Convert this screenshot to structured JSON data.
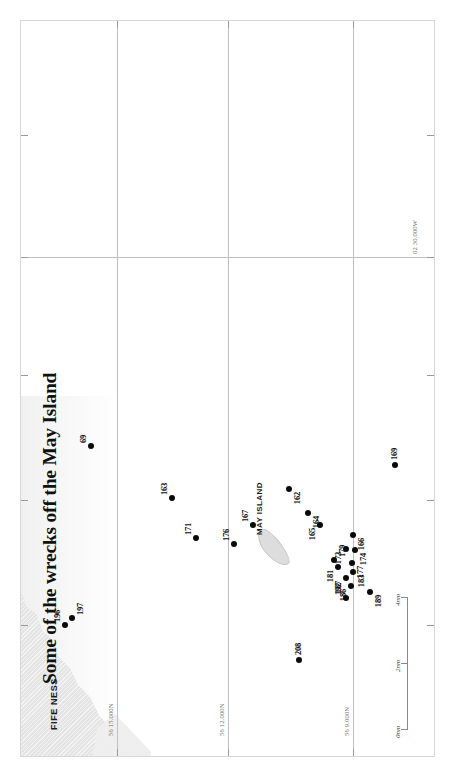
{
  "title": "Some of the wrecks off the May Island",
  "labels": {
    "fife_ness": "FIFE NESS",
    "may_island": "MAY ISLAND"
  },
  "graticule": {
    "latitudes": [
      {
        "text": "56 15.000N",
        "y": 96
      },
      {
        "text": "56 12.000N",
        "y": 207
      },
      {
        "text": "56 9.000N",
        "y": 332
      }
    ],
    "longitudes": [
      {
        "text": "02 30.000W",
        "x": 498
      }
    ]
  },
  "scale": {
    "ticks": [
      "0nm",
      "2nm",
      "4nm"
    ]
  },
  "chart_data": {
    "type": "scatter",
    "title": "Some of the wrecks off the May Island",
    "xlabel": "Longitude",
    "ylabel": "Latitude",
    "grid": true,
    "legend": "none",
    "annotations": [
      "FIFE NESS",
      "MAY ISLAND"
    ],
    "axis_ticks": {
      "latitude": [
        "56 15.000N",
        "56 12.000N",
        "56 9.000N"
      ],
      "longitude": [
        "02 30.000W"
      ]
    },
    "scale_bar": [
      "0nm",
      "2nm",
      "4nm"
    ],
    "points": [
      {
        "label": "196",
        "x": 131,
        "y": 44,
        "pos": "tr"
      },
      {
        "label": "197",
        "x": 138,
        "y": 51,
        "pos": "br"
      },
      {
        "label": "69",
        "x": 310,
        "y": 70,
        "pos": "tr"
      },
      {
        "label": "208",
        "x": 96,
        "y": 278,
        "pos": "r"
      },
      {
        "label": "163",
        "x": 258,
        "y": 151,
        "pos": "tr"
      },
      {
        "label": "171",
        "x": 218,
        "y": 175,
        "pos": "tr"
      },
      {
        "label": "176",
        "x": 212,
        "y": 213,
        "pos": "tr"
      },
      {
        "label": "167",
        "x": 231,
        "y": 232,
        "pos": "tr"
      },
      {
        "label": "162",
        "x": 267,
        "y": 268,
        "pos": "bl"
      },
      {
        "label": "164",
        "x": 243,
        "y": 287,
        "pos": "bl"
      },
      {
        "label": "165",
        "x": 231,
        "y": 299,
        "pos": "tl"
      },
      {
        "label": "192",
        "x": 158,
        "y": 325,
        "pos": "tr"
      },
      {
        "label": "186",
        "x": 170,
        "y": 330,
        "pos": "tl"
      },
      {
        "label": "187",
        "x": 178,
        "y": 325,
        "pos": "tl"
      },
      {
        "label": "183",
        "x": 184,
        "y": 332,
        "pos": "bl"
      },
      {
        "label": "181",
        "x": 189,
        "y": 317,
        "pos": "tl"
      },
      {
        "label": "179",
        "x": 196,
        "y": 313,
        "pos": "br"
      },
      {
        "label": "177",
        "x": 193,
        "y": 331,
        "pos": "bl"
      },
      {
        "label": "173",
        "x": 207,
        "y": 325,
        "pos": "tl"
      },
      {
        "label": "174",
        "x": 206,
        "y": 334,
        "pos": "bl"
      },
      {
        "label": "166",
        "x": 221,
        "y": 332,
        "pos": "bl"
      },
      {
        "label": "189",
        "x": 164,
        "y": 349,
        "pos": "bl"
      },
      {
        "label": "169",
        "x": 291,
        "y": 374,
        "pos": "r"
      }
    ]
  }
}
